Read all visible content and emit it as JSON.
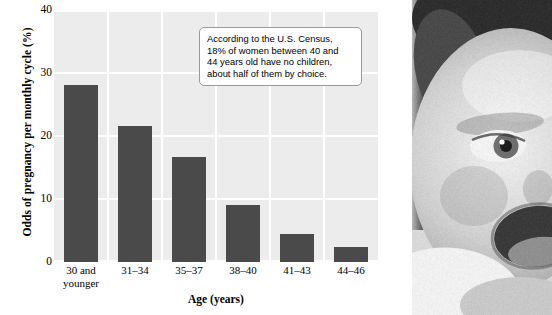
{
  "chart_data": {
    "type": "bar",
    "title": "",
    "xlabel": "Age (years)",
    "ylabel": "Odds of pregnancy per monthly cycle (%)",
    "categories": [
      "30 and younger",
      "31–34",
      "35–37",
      "38–40",
      "41–43",
      "44–46"
    ],
    "values": [
      28.1,
      21.6,
      16.7,
      9.0,
      4.4,
      2.4
    ],
    "ylim": [
      0,
      40
    ],
    "yticks": [
      0,
      10,
      20,
      30,
      40
    ],
    "ytick_labels": [
      "0",
      "10",
      "20",
      "30",
      "40"
    ],
    "grid": true,
    "legend": "none",
    "bar_color": "#4a4a4a",
    "plot_background": "#ececec",
    "gridline_color": "#ffffff",
    "annotations": [
      {
        "name": "census-callout",
        "lines": [
          "According to the U.S. Census,",
          "18% of women between 40 and",
          "44 years old have no children,",
          "about half of them by choice."
        ]
      }
    ]
  },
  "x_tick_labels": [
    [
      "30 and",
      "younger"
    ],
    [
      "31–34"
    ],
    [
      "35–37"
    ],
    [
      "38–40"
    ],
    [
      "41–43"
    ],
    [
      "44–46"
    ]
  ],
  "photo": {
    "description": "black-and-white photograph of a smiling baby's face"
  }
}
